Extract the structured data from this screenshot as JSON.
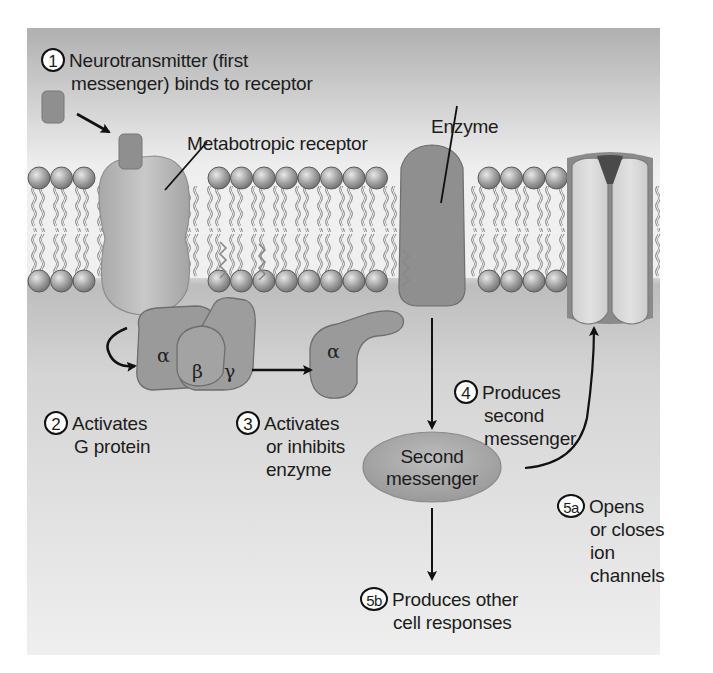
{
  "colors": {
    "background_top": "#b3b3b3",
    "background_mid": "#f2f2f2",
    "cytoplasm": "#c2c2c2",
    "cytoplasm_bottom": "#ececec",
    "protein_dark": "#8d8d8d",
    "protein_medium": "#a5a5a5",
    "protein_light": "#d6d6d6",
    "lipid_head": "#9a9a9a",
    "second_messenger": "#a8a8a8"
  },
  "steps": {
    "s1": {
      "num": "1",
      "lines": [
        "Neurotransmitter (first",
        "messenger) binds to receptor"
      ]
    },
    "s2": {
      "num": "2",
      "lines": [
        "Activates",
        "G protein"
      ]
    },
    "s3": {
      "num": "3",
      "lines": [
        "Activates",
        "or inhibits",
        "enzyme"
      ]
    },
    "s4": {
      "num": "4",
      "lines": [
        "Produces",
        "second",
        "messenger"
      ]
    },
    "s5a": {
      "num": "5a",
      "lines": [
        "Opens",
        "or closes",
        "ion",
        "channels"
      ]
    },
    "s5b": {
      "num": "5b",
      "lines": [
        "Produces other",
        "cell responses"
      ]
    }
  },
  "labels": {
    "receptor": "Metabotropic receptor",
    "enzyme": "Enzyme",
    "second_messenger_line1": "Second",
    "second_messenger_line2": "messenger"
  },
  "g_protein": {
    "alpha": "α",
    "beta": "β",
    "gamma": "γ",
    "alpha_active": "α"
  }
}
